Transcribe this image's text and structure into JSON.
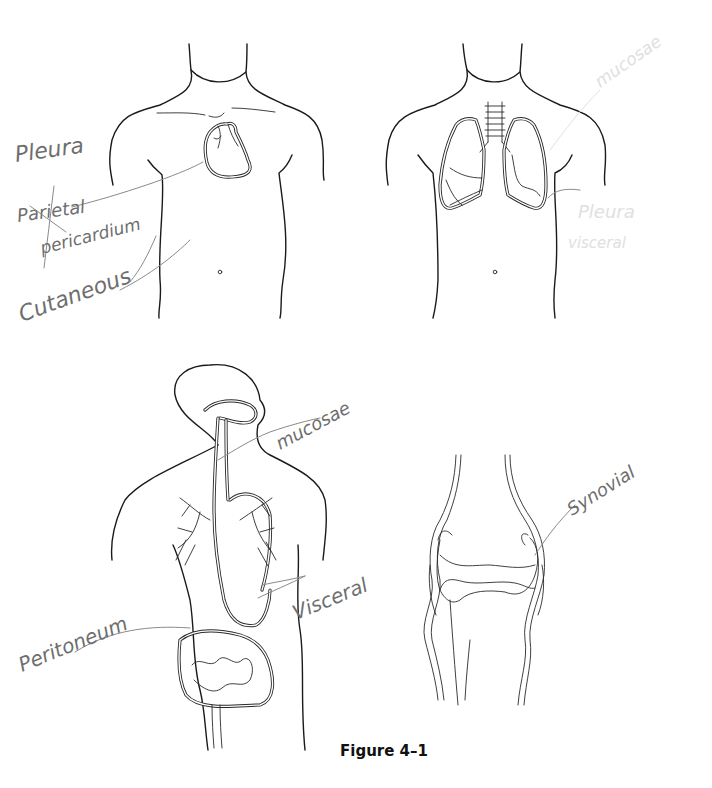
{
  "figure": {
    "caption": "Figure 4–1",
    "panels": [
      {
        "id": "anterior-chest-heart",
        "subject": "torso with heart",
        "labels": [
          {
            "text": "Pleura",
            "struck": false
          },
          {
            "text": "Parietal",
            "struck": true
          },
          {
            "text": "pericardium",
            "struck": false
          },
          {
            "text": "Cutaneous",
            "struck": false
          }
        ]
      },
      {
        "id": "anterior-chest-lungs",
        "subject": "torso with lungs and trachea",
        "labels": [
          {
            "text": "mucosae",
            "erased": true
          },
          {
            "text": "Pleura",
            "erased": true
          },
          {
            "text": "visceral",
            "erased": true
          }
        ]
      },
      {
        "id": "digestive-respiratory-tract",
        "subject": "head and torso with digestive and respiratory tracts",
        "labels": [
          {
            "text": "mucosae"
          },
          {
            "text": "Visceral"
          },
          {
            "text": "Peritoneum"
          }
        ]
      },
      {
        "id": "knee-joint",
        "subject": "knee joint",
        "labels": [
          {
            "text": "Synovial"
          }
        ]
      }
    ]
  }
}
